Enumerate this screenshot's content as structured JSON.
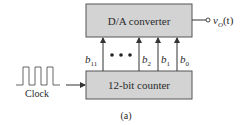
{
  "diagram": {
    "caption": "(a)",
    "blocks": {
      "dac": {
        "label": "D/A converter",
        "fill": "#d3d3d3",
        "stroke": "#555555"
      },
      "counter": {
        "label": "12-bit counter",
        "fill": "#d3d3d3",
        "stroke": "#555555"
      }
    },
    "output": {
      "symbol": "v",
      "subscript": "O",
      "argument": "(t)"
    },
    "clock": {
      "label": "Clock",
      "pulse_count": 3
    },
    "bits": [
      {
        "name": "b",
        "sub": "11"
      },
      {
        "name": "b",
        "sub": "2"
      },
      {
        "name": "b",
        "sub": "1"
      },
      {
        "name": "b",
        "sub": "0"
      }
    ],
    "ellipsis": "• • •",
    "colors": {
      "line": "#333333",
      "text": "#2a2a2a"
    }
  }
}
